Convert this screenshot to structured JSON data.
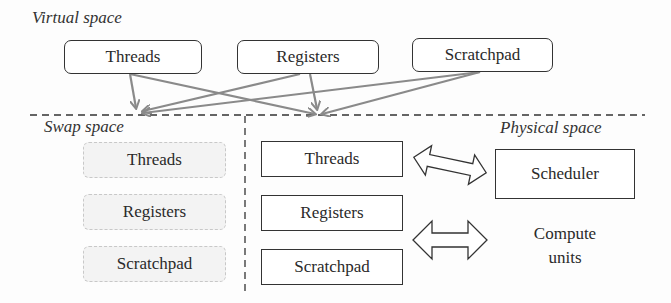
{
  "regions": {
    "virtual": {
      "label": "Virtual space",
      "items": [
        "Threads",
        "Registers",
        "Scratchpad"
      ]
    },
    "swap": {
      "label": "Swap space",
      "items": [
        "Threads",
        "Registers",
        "Scratchpad"
      ]
    },
    "physical": {
      "label": "Physical space",
      "items": [
        "Threads",
        "Registers",
        "Scratchpad"
      ],
      "scheduler": "Scheduler",
      "compute_units": [
        "Compute",
        "units"
      ]
    }
  },
  "colors": {
    "arrow": "#8a8a8a",
    "border": "#333333",
    "swap_fill": "#f3f3f3",
    "divider": "#333333"
  },
  "connections": [
    {
      "from": "virtual.Threads",
      "to": "swap"
    },
    {
      "from": "virtual.Threads",
      "to": "physical"
    },
    {
      "from": "virtual.Registers",
      "to": "swap"
    },
    {
      "from": "virtual.Registers",
      "to": "physical"
    },
    {
      "from": "virtual.Scratchpad",
      "to": "swap"
    },
    {
      "from": "virtual.Scratchpad",
      "to": "physical"
    },
    {
      "from": "physical.Threads",
      "to": "physical.Scheduler",
      "type": "bidirectional"
    },
    {
      "from": "physical.Registers/Scratchpad",
      "to": "physical.Compute units",
      "type": "bidirectional"
    }
  ]
}
